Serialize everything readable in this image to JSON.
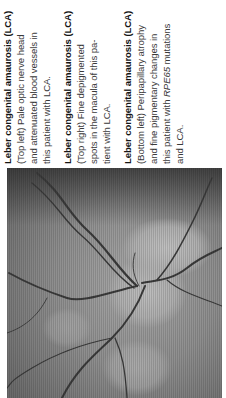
{
  "captions": [
    {
      "title": "Leber congenital amaurosis (LCA)",
      "lines": [
        "(Top left) Pale optic nerve head",
        "and attenuated blood vessels in",
        "this patient with LCA."
      ]
    },
    {
      "title": "Leber congenital amaurosis (LCA)",
      "lines": [
        "(Top right) Fine depigmented",
        "spots in the macula of this pa-",
        "tient with LCA."
      ]
    },
    {
      "title": "Leber congenital amaurosis (LCA)",
      "lines": [
        "(Bottom left) Peripapillary atrophy",
        "and fine pigmentary changes in"
      ],
      "line_with_gene": {
        "before": "this patient with ",
        "gene": "RPE65",
        "after": " mutations"
      },
      "last_line": "and LCA."
    }
  ],
  "figure": {
    "colors": {
      "background": "#ffffff",
      "text": "#3a3a3a",
      "title_text": "#151515"
    }
  }
}
